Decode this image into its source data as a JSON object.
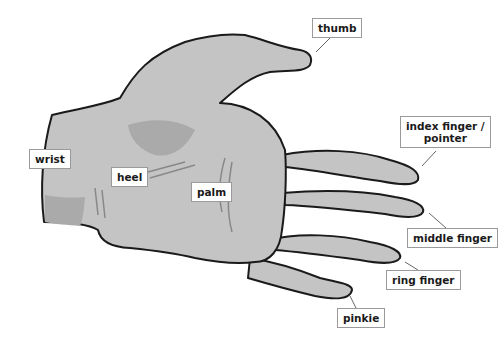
{
  "diagram": {
    "colors": {
      "skin": "#c4c4c4",
      "shadow": "#a8a8a8",
      "outline": "#1a1a1a",
      "leader": "#666666"
    },
    "labels": {
      "thumb": "thumb",
      "index_line1": "index finger /",
      "index_line2": "pointer",
      "middle": "middle finger",
      "ring": "ring finger",
      "pinkie": "pinkie",
      "wrist": "wrist",
      "heel": "heel",
      "palm": "palm"
    }
  }
}
